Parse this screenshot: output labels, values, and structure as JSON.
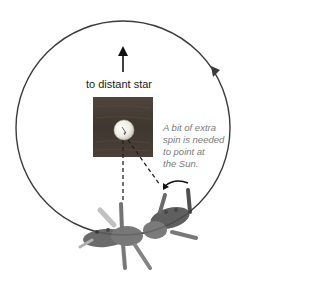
{
  "diagram": {
    "labels": {
      "distant_star": "to distant star",
      "note_lines": [
        "A bit of extra",
        "spin is needed",
        "to point at",
        "the Sun."
      ]
    },
    "elements": {
      "orbit": {
        "cx": 123,
        "cy": 128,
        "r": 107,
        "direction": "counterclockwise"
      },
      "sun": {
        "cx": 124,
        "cy": 130,
        "r": 10
      },
      "frame": {
        "x": 93,
        "y": 97,
        "width": 60,
        "height": 60
      }
    },
    "colors": {
      "orbit": "#3a3a3a",
      "frame": "#4a3f36",
      "sun": "#f2efe6",
      "note": "#7a7a7a",
      "arrow": "#111111"
    }
  }
}
